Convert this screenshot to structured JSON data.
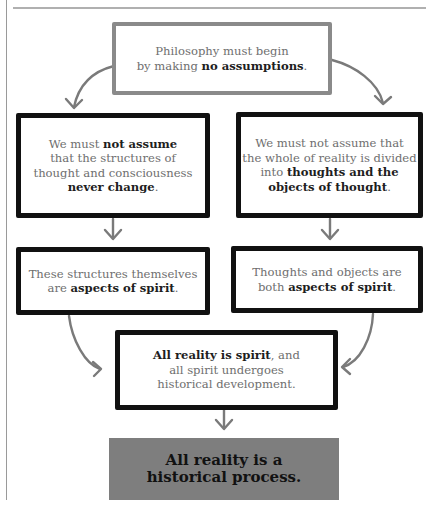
{
  "diagram": {
    "colors": {
      "arrow": "#7a7a7a",
      "top_box_border": "#8a8a8a",
      "box_border": "#111111",
      "final_box_fill": "#7e7e7e",
      "text_regular": "#6e6e6e",
      "text_bold": "#1e1e1e"
    },
    "top": {
      "line1": "Philosophy must begin",
      "line2_pre": "by making ",
      "line2_bold": "no assumptions",
      "line2_post": "."
    },
    "left2": {
      "l1_pre": "We must ",
      "l1_bold": "not assume",
      "l2": "that the structures of",
      "l3": "thought and consciousness",
      "l4_bold": "never change",
      "l4_post": "."
    },
    "right2": {
      "l1": "We must not assume that",
      "l2": "the whole of reality is divided",
      "l3_pre": "into ",
      "l3_bold": "thoughts and the",
      "l4_bold": "objects of thought",
      "l4_post": "."
    },
    "left3": {
      "l1": "These structures themselves",
      "l2_pre": "are ",
      "l2_bold": "aspects of spirit",
      "l2_post": "."
    },
    "right3": {
      "l1": "Thoughts and objects are",
      "l2_pre": "both ",
      "l2_bold": "aspects of spirit",
      "l2_post": "."
    },
    "merge": {
      "l1_bold": "All reality is spirit",
      "l1_post": ", and",
      "l2": "all spirit undergoes",
      "l3": "historical development."
    },
    "conclusion": {
      "l1": "All reality is a",
      "l2": "historical process."
    },
    "arrow_icon": "down-arrow-icon"
  }
}
